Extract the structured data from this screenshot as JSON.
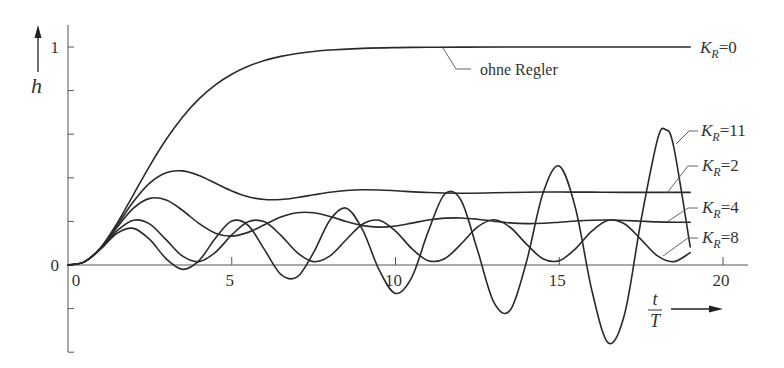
{
  "chart_data": {
    "type": "line",
    "title": "",
    "xlabel_numerator": "t",
    "xlabel_denominator": "T",
    "ylabel": "h",
    "xlim": [
      0,
      21
    ],
    "ylim": [
      -0.4,
      1.1
    ],
    "x_ticks": [
      0,
      5,
      10,
      15,
      20
    ],
    "x_tick_labels": [
      "0",
      "5",
      "10",
      "15",
      "20"
    ],
    "y_ticks": [
      -0.4,
      -0.2,
      0,
      0.2,
      0.4,
      0.6,
      0.8,
      1
    ],
    "y_tick_labels": [
      {
        "value": 0,
        "label": "0"
      },
      {
        "value": 1,
        "label": "1"
      }
    ],
    "grid": false,
    "legend": "inline-right",
    "annotation": "ohne Regler",
    "series": [
      {
        "id": "k0",
        "name": "K_R=0",
        "label_main": "K",
        "label_sub": "R",
        "label_value": "=0",
        "x": [
          0,
          0.5,
          1,
          1.5,
          2,
          2.5,
          3,
          3.5,
          4,
          4.5,
          5,
          5.5,
          6,
          6.5,
          7,
          7.5,
          8,
          9,
          10,
          11,
          12,
          14,
          16,
          19
        ],
        "y": [
          0,
          0.0144,
          0.0803,
          0.1912,
          0.3233,
          0.4562,
          0.5768,
          0.6792,
          0.7619,
          0.8264,
          0.8753,
          0.9116,
          0.938,
          0.957,
          0.9704,
          0.9797,
          0.9862,
          0.9938,
          0.9972,
          0.9988,
          0.9995,
          0.9999,
          1.0,
          1.0
        ]
      },
      {
        "id": "k11",
        "name": "K_R=11",
        "label_main": "K",
        "label_sub": "R",
        "label_value": "=11",
        "x": [
          0,
          0.5,
          1,
          1.5,
          2,
          2.5,
          3,
          3.5,
          4,
          4.5,
          5,
          5.5,
          6,
          6.5,
          7,
          7.5,
          8,
          8.5,
          9,
          9.5,
          10,
          10.5,
          11,
          11.5,
          12,
          12.5,
          13,
          13.5,
          14,
          14.5,
          15,
          15.5,
          16,
          16.5,
          17,
          17.5,
          18,
          18.25,
          18.5,
          19
        ],
        "y": [
          0,
          0.0142,
          0.0739,
          0.1454,
          0.1681,
          0.116,
          0.0284,
          -0.0201,
          0.0202,
          0.1227,
          0.2016,
          0.182,
          0.0704,
          -0.0427,
          -0.0544,
          0.0579,
          0.2068,
          0.2608,
          0.1599,
          -0.0226,
          -0.1305,
          -0.0559,
          0.1542,
          0.3246,
          0.297,
          0.0698,
          -0.1705,
          -0.2081,
          0.0152,
          0.3276,
          0.4539,
          0.258,
          -0.1195,
          -0.3577,
          -0.2223,
          0.2076,
          0.5757,
          0.6207,
          0.5383,
          0.0832
        ]
      },
      {
        "id": "k2",
        "name": "K_R=2",
        "label_main": "K",
        "label_sub": "R",
        "label_value": "=2",
        "x": [
          0,
          0.5,
          1,
          1.5,
          2,
          2.5,
          3,
          3.5,
          4,
          4.5,
          5,
          5.5,
          6,
          6.5,
          7,
          7.5,
          8,
          8.5,
          9,
          9.5,
          10,
          11,
          12,
          13,
          14,
          15,
          16,
          17,
          19
        ],
        "y": [
          0,
          0.0143,
          0.0791,
          0.1824,
          0.2911,
          0.3766,
          0.4236,
          0.4316,
          0.4107,
          0.375,
          0.3395,
          0.3131,
          0.3004,
          0.3005,
          0.3094,
          0.322,
          0.3338,
          0.3418,
          0.345,
          0.3441,
          0.3406,
          0.3324,
          0.3293,
          0.3312,
          0.3339,
          0.3347,
          0.3341,
          0.3333,
          0.3333
        ]
      },
      {
        "id": "k4",
        "name": "K_R=4",
        "label_main": "K",
        "label_sub": "R",
        "label_value": "=4",
        "x": [
          0,
          0.5,
          1,
          1.5,
          2,
          2.5,
          3,
          3.5,
          4,
          4.5,
          5,
          5.5,
          6,
          6.5,
          7,
          7.5,
          8,
          8.5,
          9,
          9.5,
          10,
          10.5,
          11,
          11.5,
          12,
          12.5,
          13,
          13.5,
          14,
          14.5,
          15,
          15.5,
          16,
          16.5,
          17,
          17.5,
          18,
          18.5,
          19
        ],
        "y": [
          0,
          0.0143,
          0.0779,
          0.1737,
          0.2608,
          0.3056,
          0.2976,
          0.2501,
          0.1905,
          0.146,
          0.1324,
          0.1497,
          0.1848,
          0.2198,
          0.24,
          0.2396,
          0.2227,
          0.1994,
          0.1807,
          0.1736,
          0.1789,
          0.192,
          0.2061,
          0.2149,
          0.2159,
          0.2101,
          0.201,
          0.1933,
          0.1898,
          0.1912,
          0.1961,
          0.2017,
          0.2055,
          0.2063,
          0.2043,
          0.2009,
          0.1977,
          0.1961,
          0.1964
        ]
      },
      {
        "id": "k8",
        "name": "K_R=8",
        "label_main": "K",
        "label_sub": "R",
        "label_value": "=8",
        "x": [
          0,
          0.5,
          1,
          1.5,
          2,
          2.5,
          3,
          3.5,
          4,
          4.5,
          5,
          5.5,
          6,
          6.5,
          7,
          7.5,
          8,
          8.5,
          9,
          9.5,
          10,
          10.5,
          11,
          11.5,
          12,
          12.5,
          13,
          13.5,
          14,
          14.5,
          15,
          15.5,
          16,
          16.5,
          17,
          17.5,
          18,
          18.5,
          19
        ],
        "y": [
          0,
          0.0143,
          0.0756,
          0.1573,
          0.2054,
          0.1873,
          0.115,
          0.0404,
          0.0156,
          0.0581,
          0.1379,
          0.1988,
          0.1979,
          0.1361,
          0.0566,
          0.0154,
          0.0418,
          0.117,
          0.1881,
          0.205,
          0.1557,
          0.075,
          0.0198,
          0.0289,
          0.0958,
          0.1736,
          0.2073,
          0.1732,
          0.0955,
          0.0287,
          0.0199,
          0.0754,
          0.1561,
          0.2051,
          0.1881,
          0.1167,
          0.0416,
          0.0154,
          0.0567
        ]
      }
    ]
  }
}
